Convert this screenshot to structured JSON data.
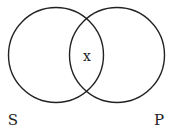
{
  "diagram": {
    "type": "venn",
    "sets": [
      {
        "name": "S",
        "label": "S"
      },
      {
        "name": "P",
        "label": "P"
      }
    ],
    "intersection_label": "x",
    "stroke_color": "#222222",
    "background": "#ffffff"
  }
}
